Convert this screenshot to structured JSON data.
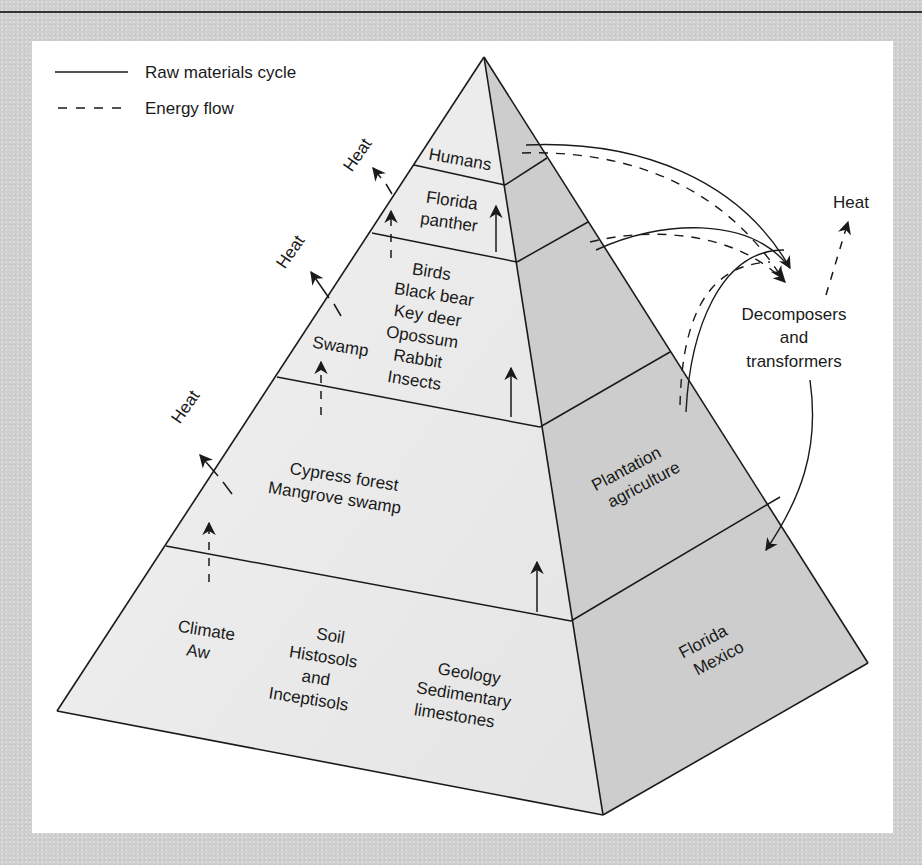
{
  "legend": {
    "items": [
      {
        "style": "solid",
        "label": "Raw materials cycle"
      },
      {
        "style": "dashed",
        "label": "Energy flow"
      }
    ]
  },
  "pyramid": {
    "front_face_levels": [
      {
        "name": "top",
        "lines": [
          "Humans"
        ]
      },
      {
        "name": "carnivore",
        "lines": [
          "Florida",
          "panther"
        ]
      },
      {
        "name": "consumers",
        "lines": [
          "Birds",
          "Black bear",
          "Key deer",
          "Opossum",
          "Rabbit",
          "Insects"
        ],
        "side_label": "Swamp"
      },
      {
        "name": "producers",
        "lines": [
          "Cypress forest",
          "Mangrove swamp"
        ]
      },
      {
        "name": "base",
        "groups": [
          {
            "lines": [
              "Climate",
              "Aw"
            ]
          },
          {
            "lines": [
              "Soil",
              "Histosols",
              "and",
              "Inceptisols"
            ]
          },
          {
            "lines": [
              "Geology",
              "Sedimentary",
              "limestones"
            ]
          }
        ]
      }
    ],
    "side_face_labels": {
      "producers": [
        "Plantation",
        "agriculture"
      ],
      "base": [
        "Florida",
        "Mexico"
      ]
    }
  },
  "heat_labels": [
    "Heat",
    "Heat",
    "Heat",
    "Heat"
  ],
  "decomposers": {
    "lines": [
      "Decomposers",
      "and",
      "transformers"
    ]
  },
  "colors": {
    "background": "#cfcfcf",
    "panel": "#ffffff",
    "front_face": "#ececec",
    "side_face": "#cdcdcd",
    "line": "#1a1a1a"
  }
}
